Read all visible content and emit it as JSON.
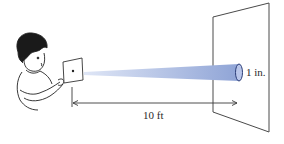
{
  "diagram": {
    "labels": {
      "distance": "10 ft",
      "beam_diameter": "1 in."
    },
    "colors": {
      "beam": "#8fa4d6",
      "beam_light": "#c9d3ee",
      "line": "#3a3a3a"
    },
    "elements": [
      "boy-holding-card-with-pinhole",
      "light-beam",
      "screen",
      "distance-arrow",
      "beam-spot-ellipse"
    ]
  }
}
